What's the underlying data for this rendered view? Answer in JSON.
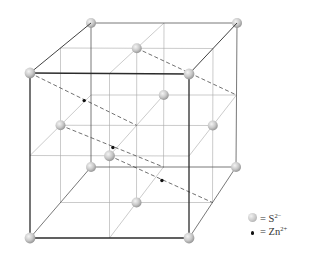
{
  "legend": [
    {
      "symbol": "sphere",
      "label": "= S",
      "charge": "2−",
      "species": "S2-"
    },
    {
      "symbol": "dot",
      "label": "= Zn",
      "charge": "2+",
      "species": "Zn2+"
    }
  ],
  "colors": {
    "edge_dark": "#2b2b2b",
    "edge_back": "#555555",
    "grid": "#a8a8a8",
    "dashed": "#333333",
    "zn": "#111111"
  },
  "lattice": {
    "type": "face-centered cubic",
    "grid_divisions": 2,
    "sulfide_sites": [
      [
        0,
        0,
        0
      ],
      [
        1,
        0,
        0
      ],
      [
        0,
        1,
        0
      ],
      [
        1,
        1,
        0
      ],
      [
        0,
        0,
        1
      ],
      [
        1,
        0,
        1
      ],
      [
        0,
        1,
        1
      ],
      [
        1,
        1,
        1
      ],
      [
        0.5,
        1,
        0.5
      ],
      [
        0.5,
        0.5,
        1
      ],
      [
        0,
        0.5,
        0.5
      ],
      [
        1,
        0.5,
        0.5
      ],
      [
        0.5,
        0.5,
        0
      ],
      [
        0.5,
        0,
        0.5
      ]
    ],
    "zinc_sites": [
      [
        0.25,
        0.75,
        0.25
      ],
      [
        0.75,
        0.75,
        0.75
      ],
      [
        0.25,
        0.25,
        0.75
      ],
      [
        0.75,
        0.25,
        0.25
      ]
    ],
    "tetrahedral_bond_lines": [
      {
        "from": [
          0,
          1,
          0
        ],
        "to": [
          0.5,
          0.5,
          0.5
        ]
      },
      {
        "from": [
          0.5,
          1,
          0.5
        ],
        "to": [
          1,
          0.5,
          1
        ]
      },
      {
        "from": [
          0,
          0.5,
          0.5
        ],
        "to": [
          0.5,
          0,
          1
        ]
      },
      {
        "from": [
          0.5,
          0.5,
          0
        ],
        "to": [
          1,
          0,
          0.5
        ]
      }
    ]
  }
}
